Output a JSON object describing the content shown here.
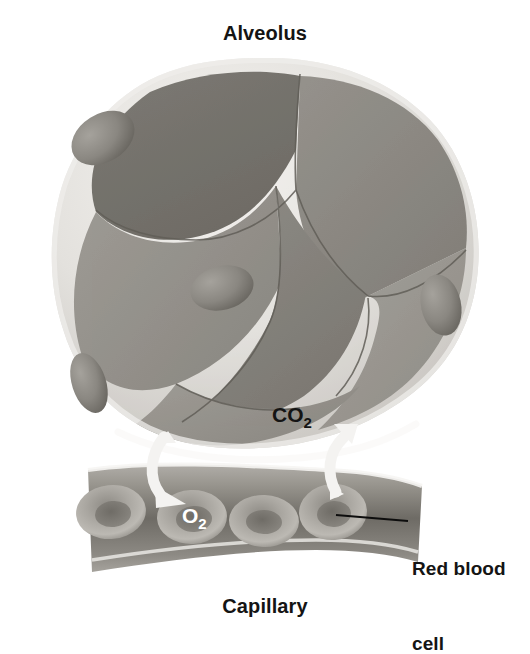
{
  "figure": {
    "title": "Alveolus",
    "background_color": "#ffffff"
  },
  "labels": {
    "alveolus": "Alveolus",
    "capillary": "Capillary",
    "red_blood_cell": "Red blood\ncell",
    "red_blood_cell_line1": "Red blood",
    "red_blood_cell_line2": "cell"
  },
  "gas_labels": {
    "carbon_dioxide": {
      "text": "CO",
      "subscript": "2",
      "color": "#141414",
      "x": 272,
      "y": 408
    },
    "oxygen": {
      "text": "O",
      "subscript": "2",
      "color": "#ffffff",
      "x": 186,
      "y": 505
    }
  },
  "arrows": [
    {
      "name": "oxygen-arrow",
      "direction": "into-capillary",
      "color": "#f2f2f0",
      "description": "curved white arrow pointing down-right from alveolus wall into capillary"
    },
    {
      "name": "carbon-dioxide-arrow",
      "direction": "into-alveolus",
      "color": "#f2f2f0",
      "description": "curved white arrow pointing up-left from capillary into alveolus"
    }
  ],
  "alveolus": {
    "rim_color": "#d8d6d2",
    "rim_highlight": "#efedea",
    "interior_light": "#9a9893",
    "interior_mid": "#8b8984",
    "interior_dark": "#737069",
    "division_line_color": "#6d6a64",
    "nuclei": [
      {
        "name": "nucleus-top-left",
        "cx": 103,
        "cy": 138,
        "rx": 34,
        "ry": 24,
        "rotate": -32
      },
      {
        "name": "nucleus-center",
        "cx": 222,
        "cy": 288,
        "rx": 32,
        "ry": 22,
        "rotate": -14
      },
      {
        "name": "nucleus-right",
        "cx": 440,
        "cy": 305,
        "rx": 20,
        "ry": 31,
        "rotate": -12
      },
      {
        "name": "nucleus-bottom-left",
        "cx": 88,
        "cy": 383,
        "rx": 17,
        "ry": 30,
        "rotate": -18
      }
    ],
    "nucleus_fill": "#8a8782",
    "nucleus_shade": "#706d67"
  },
  "capillary": {
    "wall_color": "#a8a5a0",
    "lumen_color": "#6e6b66",
    "edge_highlight": "#f4f3f1",
    "red_blood_cells": [
      {
        "name": "rbc-1",
        "cx": 111,
        "cy": 512
      },
      {
        "name": "rbc-2",
        "cx": 192,
        "cy": 517
      },
      {
        "name": "rbc-3",
        "cx": 262,
        "cy": 520
      },
      {
        "name": "rbc-4",
        "cx": 332,
        "cy": 512
      }
    ],
    "rbc_rim_color": "#b5b2ad",
    "rbc_center_color": "#7b7873",
    "count": 4
  },
  "leader_line": {
    "name": "red-blood-cell-leader",
    "color": "#0d0d0d",
    "from_x": 336,
    "from_y": 515,
    "to_x": 408,
    "to_y": 521
  }
}
